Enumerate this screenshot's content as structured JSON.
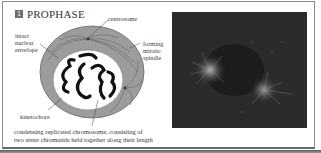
{
  "figure": {
    "step_number": "1",
    "title": "PROPHASE",
    "labels": {
      "centrosome": "centrosome",
      "nuclear_envelope": [
        "intact",
        "nuclear",
        "envelope"
      ],
      "spindle": [
        "forming",
        "mitotic",
        "spindle"
      ],
      "kinetochore": "kinetochore"
    },
    "caption": [
      "condensing replicated chromosome, consisting of",
      "two sister chromatids held together along their length"
    ],
    "micrograph": {
      "description": "fluorescence micrograph of a cell in prophase"
    }
  },
  "colors": {
    "badge": "#6e6e6e",
    "cytoplasm": "#9a9a9a",
    "nucleus": "#ffffff",
    "chromosome": "#111111",
    "micrograph_bg": "#2b2b2b",
    "frame_border": "#8a8a8a"
  }
}
